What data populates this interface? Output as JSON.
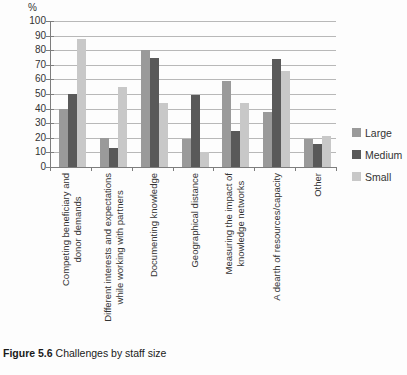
{
  "caption": {
    "label": "Figure 5.6",
    "title": "Challenges by staff size"
  },
  "chart_data": {
    "type": "bar",
    "title": "Challenges by staff size",
    "ylabel": "%",
    "xlabel": "",
    "ylim": [
      0,
      100
    ],
    "yticks": [
      0,
      10,
      20,
      30,
      40,
      50,
      60,
      70,
      80,
      90,
      100
    ],
    "grid": true,
    "legend_position": "right",
    "categories": [
      "Competing beneficiary and donor demands",
      "Different interests and expectations while working with partners",
      "Documenting knowledge",
      "Geographical distance",
      "Measuring the impact of knowledge networks",
      "A dearth of resources/capacity",
      "Other"
    ],
    "category_label_lines": [
      [
        "Competing beneficiary and",
        "donor demands"
      ],
      [
        "Different interests and expectations",
        "while working with partners"
      ],
      [
        "Documenting knowledge"
      ],
      [
        "Geographical distance"
      ],
      [
        "Measuring the impact of",
        "knowledge networks"
      ],
      [
        "A dearth of resources/capacity"
      ],
      [
        "Other"
      ]
    ],
    "series": [
      {
        "name": "Large",
        "color": "#9a9a9a",
        "values": [
          40,
          20,
          80,
          19,
          59,
          38,
          19
        ]
      },
      {
        "name": "Medium",
        "color": "#595959",
        "values": [
          50,
          13,
          75,
          49,
          25,
          74,
          16
        ]
      },
      {
        "name": "Small",
        "color": "#c8c8c8",
        "values": [
          88,
          55,
          44,
          10,
          44,
          66,
          21
        ]
      }
    ]
  }
}
